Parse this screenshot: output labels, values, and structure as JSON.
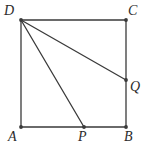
{
  "figure": {
    "kind": "plane-geometry-diagram",
    "background_color": "#ffffff",
    "stroke_color": "#3a3a3a",
    "label_color": "#2b2b2b",
    "stroke_width": 1.3,
    "vertex_dot_radius": 1.9,
    "canvas": {
      "width": 150,
      "height": 155
    }
  },
  "points": [
    {
      "id": "A",
      "label": "A",
      "x": 21,
      "y": 127,
      "label_x": 8,
      "label_y": 130,
      "marked": true
    },
    {
      "id": "B",
      "label": "B",
      "x": 126,
      "y": 127,
      "label_x": 124,
      "label_y": 130,
      "marked": true
    },
    {
      "id": "C",
      "label": "C",
      "x": 126,
      "y": 20,
      "label_x": 128,
      "label_y": 4,
      "marked": true
    },
    {
      "id": "D",
      "label": "D",
      "x": 21,
      "y": 20,
      "label_x": 4,
      "label_y": 4,
      "marked": true
    },
    {
      "id": "P",
      "label": "P",
      "x": 84,
      "y": 127,
      "label_x": 78,
      "label_y": 130,
      "marked": true
    },
    {
      "id": "Q",
      "label": "Q",
      "x": 126,
      "y": 80,
      "label_x": 130,
      "label_y": 80,
      "marked": true
    }
  ],
  "segments": [
    {
      "id": "AB",
      "name": "side-ab",
      "x1": 21,
      "y1": 127,
      "x2": 126,
      "y2": 127
    },
    {
      "id": "BC",
      "name": "side-bc",
      "x1": 126,
      "y1": 127,
      "x2": 126,
      "y2": 20
    },
    {
      "id": "CD",
      "name": "side-cd",
      "x1": 126,
      "y1": 20,
      "x2": 21,
      "y2": 20
    },
    {
      "id": "DA",
      "name": "side-da",
      "x1": 21,
      "y1": 20,
      "x2": 21,
      "y2": 127
    },
    {
      "id": "DQ",
      "name": "segment-dq",
      "x1": 21,
      "y1": 20,
      "x2": 126,
      "y2": 80
    },
    {
      "id": "DP",
      "name": "segment-dp",
      "x1": 21,
      "y1": 20,
      "x2": 84,
      "y2": 127
    }
  ]
}
